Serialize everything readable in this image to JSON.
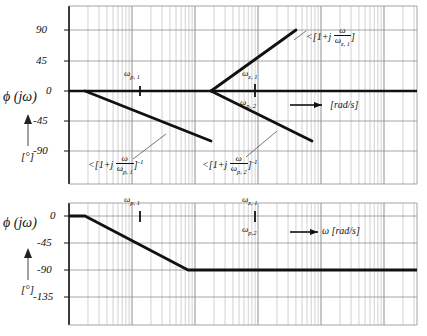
{
  "figure": {
    "kind": "bode-phase-asymptote-plot"
  },
  "chart_data": [
    {
      "type": "line",
      "id": "individual-phase-asymptotes",
      "title": "",
      "xlabel": "[rad/s]",
      "ylabel": "ϕ (jω)",
      "yunit": "[°]",
      "xscale": "log",
      "grid": true,
      "legend": "none",
      "yticks": [
        90,
        45,
        0,
        -45,
        -90
      ],
      "ytick_labels": [
        "90",
        "45",
        "0",
        "-45",
        "-90"
      ],
      "ylim": [
        -135,
        112
      ],
      "xtick_marks": [
        {
          "label": "ω p,1",
          "symbol_base": "ω",
          "symbol_sub": "p, 1",
          "position": "above-axis",
          "decade_x": 1.15
        },
        {
          "label": "ω z,1",
          "symbol_base": "ω",
          "symbol_sub": "z, 1",
          "position": "above-axis",
          "decade_x": 3.0
        },
        {
          "label": "ω p,2",
          "symbol_base": "ω",
          "symbol_sub": "p, 2",
          "position": "below-axis",
          "decade_x": 3.0
        }
      ],
      "series": [
        {
          "name": "<[1+j ω/ω z,1]",
          "kind": "zero-phase-asymptote",
          "points": [
            [
              0,
              0
            ],
            [
              2.26,
              0
            ],
            [
              3.62,
              90
            ],
            [
              5.55,
              90
            ]
          ],
          "annotation": "<[1+j ω/ωz,1]"
        },
        {
          "name": "<[1+j ω/ω p,1]^-1",
          "kind": "pole-phase-asymptote",
          "points": [
            [
              0.0,
              0
            ],
            [
              0.25,
              0
            ],
            [
              2.26,
              -90
            ],
            [
              2.26,
              -90
            ]
          ],
          "annotation": "<[1+j ω/ωp,1]^-1"
        },
        {
          "name": "<[1+j ω/ω p,2]^-1",
          "kind": "pole-phase-asymptote",
          "points": [
            [
              2.26,
              0
            ],
            [
              3.85,
              -90
            ],
            [
              3.85,
              -90
            ]
          ],
          "annotation": "<[1+j ω/ωp,2]^-1"
        }
      ]
    },
    {
      "type": "line",
      "id": "combined-phase",
      "title": "",
      "xlabel": "ω [rad/s]",
      "ylabel": "ϕ (jω)",
      "yunit": "[°]",
      "xscale": "log",
      "grid": true,
      "legend": "none",
      "yticks": [
        0,
        -45,
        -90,
        -135
      ],
      "ytick_labels": [
        "0",
        "-45",
        "-90",
        "-135"
      ],
      "ylim": [
        -160,
        12
      ],
      "xtick_marks": [
        {
          "label": "ω p,1",
          "symbol_base": "ω",
          "symbol_sub": "p, 1",
          "position": "above-axis",
          "decade_x": 1.15
        },
        {
          "label": "ω z,1",
          "symbol_base": "ω",
          "symbol_sub": "z, 1",
          "position": "above-axis",
          "decade_x": 3.0
        },
        {
          "label": "ω p,2",
          "symbol_base": "ω",
          "symbol_sub": "p, 2",
          "position": "below-axis",
          "decade_x": 3.0
        }
      ],
      "series": [
        {
          "name": "total phase",
          "kind": "combined-asymptote",
          "points": [
            [
              0.0,
              0
            ],
            [
              0.27,
              0
            ],
            [
              1.95,
              -90
            ],
            [
              5.55,
              -90
            ]
          ]
        }
      ]
    }
  ],
  "top_chart": {
    "y_labels": [
      "90",
      "45",
      "0",
      "-45",
      "-90"
    ],
    "axis_title": "ϕ (jω)",
    "axis_unit": "[°]",
    "x_unit": "[rad/s]",
    "tick_labels": {
      "wp1": {
        "base": "ω",
        "sub": "p, 1"
      },
      "wz1": {
        "base": "ω",
        "sub": "z, 1"
      },
      "wp2": {
        "base": "ω",
        "sub": "p, 2"
      }
    },
    "annotations": {
      "zero": {
        "prefix": "<[1+j",
        "num": "ω",
        "den_base": "ω",
        "den_sub": "z, 1",
        "suffix": "]",
        "exponent": ""
      },
      "pole1": {
        "prefix": "<[1+j",
        "num": "ω",
        "den_base": "ω",
        "den_sub": "p, 1",
        "suffix": "]",
        "exponent": "-1"
      },
      "pole2": {
        "prefix": "<[1+j",
        "num": "ω",
        "den_base": "ω",
        "den_sub": "p, 2",
        "suffix": "]",
        "exponent": "-1"
      }
    }
  },
  "bottom_chart": {
    "y_labels": [
      "0",
      "-45",
      "-90",
      "-135"
    ],
    "axis_title": "ϕ (jω)",
    "axis_unit": "[°]",
    "x_unit": "ω [rad/s]",
    "tick_labels": {
      "wp1": {
        "base": "ω",
        "sub": "p, 1"
      },
      "wz1": {
        "base": "ω",
        "sub": "z, 1"
      },
      "wp2": {
        "base": "ω",
        "sub": "p,2"
      }
    }
  },
  "colors": {
    "curve": "#111111",
    "grid_minor": "#b9b9b9",
    "grid_major": "#8a8a8a",
    "axis": "#111111",
    "background": "#ffffff"
  }
}
